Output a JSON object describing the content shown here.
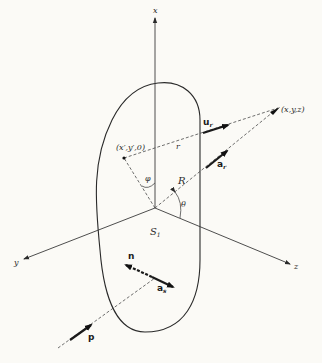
{
  "diagram": {
    "axes": {
      "x_label": "x",
      "y_label": "y",
      "z_label": "z"
    },
    "points": {
      "source_point": "(x′,y′,0)",
      "field_point": "(x,y,z)"
    },
    "distances": {
      "r_label": "r",
      "R_label": "R"
    },
    "angles": {
      "phi_label": "φ",
      "theta_label": "θ"
    },
    "surface": {
      "label_main": "S",
      "label_sub": "1"
    },
    "vectors": {
      "u_r": {
        "main": "u",
        "sub": "r"
      },
      "a_r": {
        "main": "a",
        "sub": "r"
      },
      "n": {
        "main": "n"
      },
      "a_s": {
        "main": "a",
        "sub": "s"
      },
      "p": {
        "main": "p"
      }
    }
  }
}
